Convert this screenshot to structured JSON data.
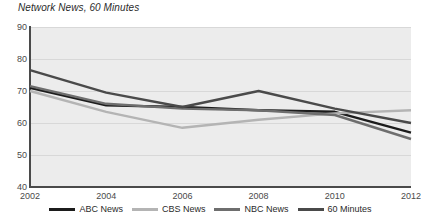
{
  "chart_data": {
    "type": "line",
    "title": "Network News, 60 Minutes",
    "xlabel": "",
    "ylabel": "",
    "x": [
      2002,
      2004,
      2006,
      2008,
      2010,
      2012
    ],
    "xtick_labels": [
      "2002",
      "2004",
      "2006",
      "2008",
      "2010",
      "2012"
    ],
    "ytick_labels": [
      "90",
      "80",
      "70",
      "60",
      "50",
      "40"
    ],
    "yticks": [
      90,
      80,
      70,
      60,
      50,
      40
    ],
    "ylim": [
      40,
      90
    ],
    "xlim": [
      2002,
      2012
    ],
    "grid": true,
    "legend_position": "bottom",
    "series": [
      {
        "name": "ABC News",
        "color": "#1c1c1c",
        "values": [
          71.0,
          65.5,
          65.0,
          64.0,
          63.5,
          57.0
        ]
      },
      {
        "name": "CBS News",
        "color": "#b4b4b4",
        "values": [
          70.0,
          63.5,
          58.5,
          61.0,
          63.0,
          64.0
        ]
      },
      {
        "name": "NBC News",
        "color": "#6e6e6e",
        "values": [
          71.5,
          66.0,
          64.5,
          64.0,
          62.5,
          55.0
        ]
      },
      {
        "name": "60 Minutes",
        "color": "#4a4a4a",
        "values": [
          76.5,
          69.5,
          65.0,
          70.0,
          64.5,
          60.0
        ]
      }
    ]
  },
  "legend": {
    "items": [
      {
        "label": "ABC News",
        "color": "#1c1c1c"
      },
      {
        "label": "CBS News",
        "color": "#b4b4b4"
      },
      {
        "label": "NBC News",
        "color": "#6e6e6e"
      },
      {
        "label": "60 Minutes",
        "color": "#4a4a4a"
      }
    ]
  }
}
